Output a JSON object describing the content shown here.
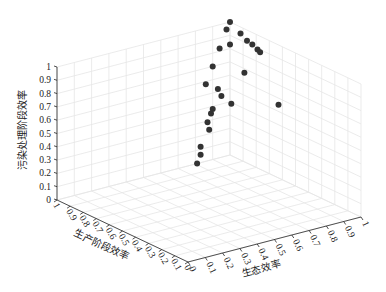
{
  "chart_data": {
    "type": "scatter",
    "dimensions": 3,
    "title": "",
    "xlabel": "生态效率",
    "ylabel": "生产阶段效率",
    "zlabel": "污染处理阶段效率",
    "xlim": [
      0,
      1
    ],
    "ylim": [
      0,
      1
    ],
    "zlim": [
      0,
      1
    ],
    "grid": true,
    "x_ticks": [
      "0",
      "0.1",
      "0.2",
      "0.3",
      "0.4",
      "0.5",
      "0.6",
      "0.7",
      "0.8",
      "0.9",
      "1"
    ],
    "y_ticks": [
      "0",
      "0.1",
      "0.2",
      "0.3",
      "0.4",
      "0.5",
      "0.6",
      "0.7",
      "0.8",
      "0.9",
      "1"
    ],
    "z_ticks": [
      "0",
      "0.1",
      "0.2",
      "0.3",
      "0.4",
      "0.5",
      "0.6",
      "0.7",
      "0.8",
      "0.9",
      "1"
    ],
    "marker_color": "#333333",
    "series": [
      {
        "name": "points",
        "points": [
          {
            "x": 1.0,
            "y": 1.0,
            "z": 1.0
          },
          {
            "x": 0.98,
            "y": 1.0,
            "z": 0.95
          },
          {
            "x": 1.0,
            "y": 0.92,
            "z": 0.95
          },
          {
            "x": 1.0,
            "y": 0.87,
            "z": 0.92
          },
          {
            "x": 1.0,
            "y": 0.83,
            "z": 0.91
          },
          {
            "x": 1.0,
            "y": 0.79,
            "z": 0.89
          },
          {
            "x": 1.0,
            "y": 0.77,
            "z": 0.88
          },
          {
            "x": 1.0,
            "y": 1.0,
            "z": 0.83
          },
          {
            "x": 0.94,
            "y": 1.0,
            "z": 0.82
          },
          {
            "x": 0.9,
            "y": 1.0,
            "z": 0.7
          },
          {
            "x": 1.0,
            "y": 0.89,
            "z": 0.67
          },
          {
            "x": 0.86,
            "y": 1.0,
            "z": 0.58
          },
          {
            "x": 0.93,
            "y": 1.0,
            "z": 0.52
          },
          {
            "x": 0.95,
            "y": 1.0,
            "z": 0.46
          },
          {
            "x": 1.0,
            "y": 0.99,
            "z": 0.39
          },
          {
            "x": 1.0,
            "y": 0.63,
            "z": 0.55
          },
          {
            "x": 0.9,
            "y": 1.0,
            "z": 0.38
          },
          {
            "x": 0.89,
            "y": 1.0,
            "z": 0.35
          },
          {
            "x": 0.87,
            "y": 1.0,
            "z": 0.29
          },
          {
            "x": 0.88,
            "y": 1.0,
            "z": 0.23
          },
          {
            "x": 0.83,
            "y": 1.0,
            "z": 0.12
          },
          {
            "x": 0.83,
            "y": 1.0,
            "z": 0.06
          },
          {
            "x": 0.81,
            "y": 1.0,
            "z": 0.0
          }
        ]
      }
    ]
  }
}
